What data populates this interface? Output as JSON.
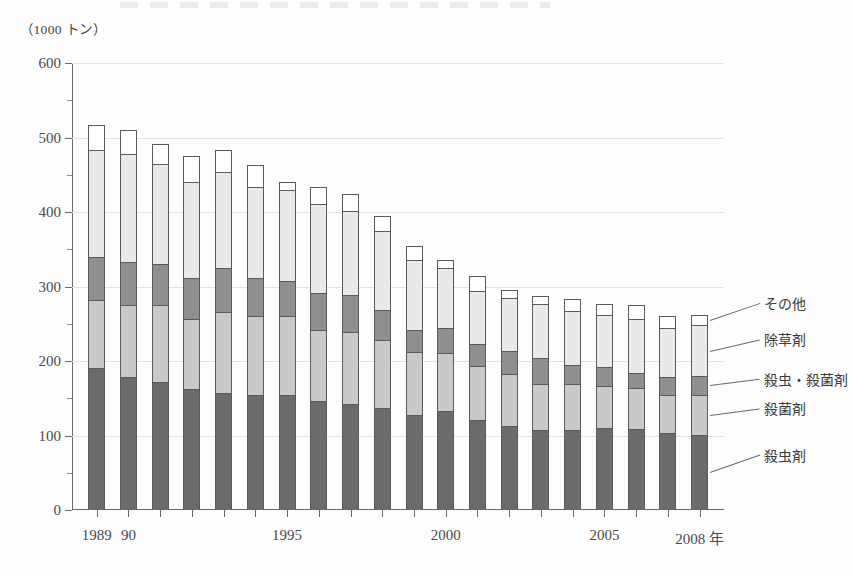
{
  "unit_label": "（1000 トン）",
  "axis": {
    "y_ticks": [
      "0",
      "100",
      "200",
      "300",
      "400",
      "500",
      "600"
    ],
    "x_labels": [
      "1989",
      "90",
      "1995",
      "2000",
      "2005",
      "2008 年"
    ],
    "x_label_years": [
      1989,
      1990,
      1995,
      2000,
      2005,
      2008
    ],
    "x_axis_suffix": "年"
  },
  "legend": {
    "sonota": "その他",
    "josouzai": "除草剤",
    "satchu_sakkin": "殺虫・殺菌剤",
    "sakkinzai": "殺菌剤",
    "satchuzai": "殺虫剤"
  },
  "colors": {
    "satchuzai": "#6b6b6b",
    "sakkinzai": "#c9c9c9",
    "satchu_sakkin": "#8f8f8f",
    "josouzai": "#e9e9e9",
    "sonota": "#ffffff",
    "outline": "#5a5a5a",
    "gridline": "#e2e2e2",
    "axis": "#6b6b6b"
  },
  "chart_data": {
    "type": "bar",
    "stacked": true,
    "title": "",
    "subtitle": "",
    "xlabel": "年",
    "ylabel": "（1000 トン）",
    "ylim": [
      0,
      600
    ],
    "ytick_step": 100,
    "yminor_step": 50,
    "grid": true,
    "legend_position": "right-callout",
    "categories": [
      "1989",
      "1990",
      "1991",
      "1992",
      "1993",
      "1994",
      "1995",
      "1996",
      "1997",
      "1998",
      "1999",
      "2000",
      "2001",
      "2002",
      "2003",
      "2004",
      "2005",
      "2006",
      "2007",
      "2008"
    ],
    "series": [
      {
        "name": "殺虫剤",
        "color": "#6b6b6b",
        "values": [
          190,
          178,
          172,
          163,
          157,
          155,
          154,
          147,
          142,
          137,
          128,
          133,
          121,
          113,
          107,
          108,
          110,
          109,
          103,
          101
        ]
      },
      {
        "name": "殺菌剤",
        "color": "#c9c9c9",
        "values": [
          92,
          97,
          103,
          94,
          109,
          106,
          106,
          95,
          97,
          91,
          84,
          78,
          72,
          70,
          62,
          61,
          56,
          55,
          51,
          54
        ]
      },
      {
        "name": "殺虫・殺菌剤",
        "color": "#8f8f8f",
        "values": [
          57,
          58,
          55,
          54,
          59,
          50,
          48,
          49,
          50,
          40,
          30,
          33,
          30,
          30,
          35,
          25,
          26,
          20,
          24,
          25
        ]
      },
      {
        "name": "除草剤",
        "color": "#e9e9e9",
        "values": [
          144,
          145,
          135,
          130,
          129,
          122,
          121,
          120,
          113,
          107,
          93,
          81,
          71,
          72,
          73,
          73,
          70,
          73,
          67,
          68
        ]
      },
      {
        "name": "その他",
        "color": "#ffffff",
        "values": [
          34,
          32,
          26,
          34,
          29,
          30,
          11,
          22,
          22,
          20,
          19,
          11,
          20,
          10,
          10,
          16,
          15,
          18,
          15,
          14
        ]
      }
    ],
    "totals": [
      517,
      510,
      491,
      475,
      483,
      463,
      440,
      433,
      424,
      395,
      354,
      336,
      314,
      295,
      287,
      283,
      277,
      275,
      260,
      262
    ]
  }
}
